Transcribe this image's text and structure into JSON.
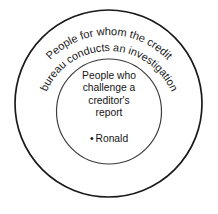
{
  "diagram": {
    "type": "euler-diagram",
    "background_color": "#ffffff",
    "outer_set": {
      "label_arc_1": "People for whom the credit",
      "label_arc_2": "bureau conducts an investigation",
      "stroke_color": "#1a1a1a"
    },
    "inner_set": {
      "label_lines": [
        "People who",
        "challenge a",
        "creditor's",
        "report"
      ],
      "stroke_color": "#3a3a3a",
      "members": [
        {
          "bullet": "•",
          "name": "Ronald"
        }
      ]
    }
  }
}
